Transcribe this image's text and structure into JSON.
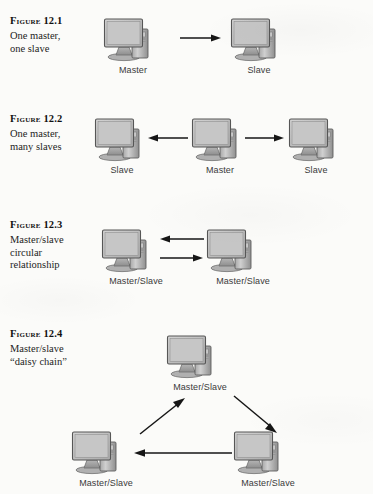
{
  "page": {
    "background_color": "#fbfbf9",
    "ink_color": "#1b1b1b",
    "icon_name": "desktop-computer-icon",
    "arrow_color": "#161616"
  },
  "figures": [
    {
      "id": "figure-12-1",
      "label": "Figure 12.1",
      "caption_lines": [
        "One master,",
        "one slave"
      ],
      "nodes": [
        {
          "label": "Master"
        },
        {
          "label": "Slave"
        }
      ],
      "arrows": [
        {
          "name": "arrow-master-to-slave",
          "direction": "right"
        }
      ]
    },
    {
      "id": "figure-12-2",
      "label": "Figure 12.2",
      "caption_lines": [
        "One master,",
        "many slaves"
      ],
      "nodes": [
        {
          "label": "Slave"
        },
        {
          "label": "Master"
        },
        {
          "label": "Slave"
        }
      ],
      "arrows": [
        {
          "name": "arrow-master-to-left-slave",
          "direction": "left"
        },
        {
          "name": "arrow-master-to-right-slave",
          "direction": "right"
        }
      ]
    },
    {
      "id": "figure-12-3",
      "label": "Figure 12.3",
      "caption_lines": [
        "Master/slave",
        "circular",
        "relationship"
      ],
      "nodes": [
        {
          "label": "Master/Slave"
        },
        {
          "label": "Master/Slave"
        }
      ],
      "arrows": [
        {
          "name": "arrow-right-to-left",
          "direction": "left"
        },
        {
          "name": "arrow-left-to-right",
          "direction": "right"
        }
      ]
    },
    {
      "id": "figure-12-4",
      "label": "Figure 12.4",
      "caption_lines": [
        "Master/slave",
        "“daisy chain”"
      ],
      "nodes": [
        {
          "label": "Master/Slave"
        },
        {
          "label": "Master/Slave"
        },
        {
          "label": "Master/Slave"
        }
      ],
      "arrows": [
        {
          "name": "arrow-bottom-left-to-top",
          "direction": "up-right"
        },
        {
          "name": "arrow-top-to-bottom-right",
          "direction": "down-right"
        },
        {
          "name": "arrow-bottom-right-to-bottom-left",
          "direction": "left"
        }
      ]
    }
  ]
}
